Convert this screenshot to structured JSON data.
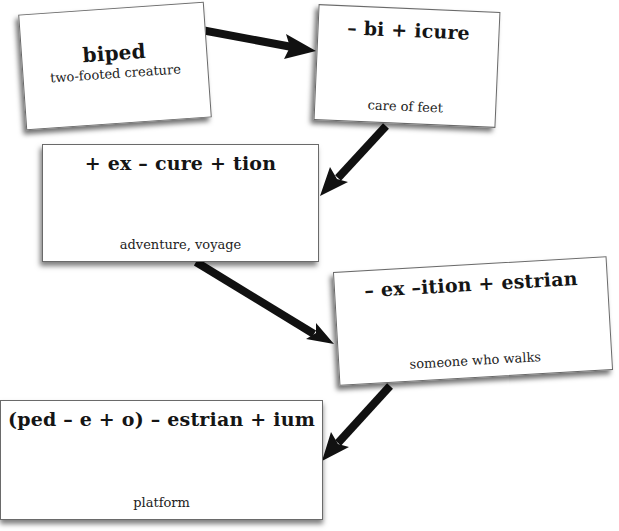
{
  "diagram": {
    "type": "word-transformation-flow",
    "cards": [
      {
        "id": "biped",
        "title": "biped",
        "definition": "two-footed creature"
      },
      {
        "id": "pedicure",
        "title": "– bi + icure",
        "definition": "care of feet"
      },
      {
        "id": "expedition",
        "title": "+ ex – cure + tion",
        "definition": "adventure, voyage"
      },
      {
        "id": "pedestrian",
        "title": "– ex –ition + estrian",
        "definition": "someone who walks"
      },
      {
        "id": "podium",
        "title": "(ped – e + o) – estrian + ium",
        "definition": "platform"
      }
    ],
    "arrows": [
      {
        "from": "biped",
        "to": "pedicure",
        "icon": "arrow-right-icon"
      },
      {
        "from": "pedicure",
        "to": "expedition",
        "icon": "arrow-down-left-icon"
      },
      {
        "from": "expedition",
        "to": "pedestrian",
        "icon": "arrow-down-right-icon"
      },
      {
        "from": "pedestrian",
        "to": "podium",
        "icon": "arrow-down-left-icon"
      }
    ],
    "colors": {
      "background": "#ffffff",
      "card": "#ffffff",
      "arrow": "#111111",
      "text": "#151515"
    }
  }
}
